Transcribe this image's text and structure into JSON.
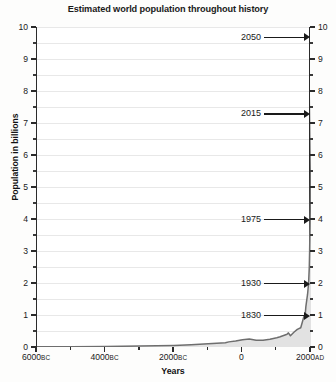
{
  "chart_data": {
    "type": "area",
    "title": "Estimated world population throughout history",
    "xlabel": "Years",
    "ylabel": "Population in billions",
    "xlim": [
      -6000,
      2000
    ],
    "ylim": [
      0,
      10
    ],
    "grid": true,
    "legend": "none",
    "y_ticks": [
      {
        "value": 0,
        "label": "0"
      },
      {
        "value": 1,
        "label": "1"
      },
      {
        "value": 2,
        "label": "2"
      },
      {
        "value": 3,
        "label": "3"
      },
      {
        "value": 4,
        "label": "4"
      },
      {
        "value": 5,
        "label": "5"
      },
      {
        "value": 6,
        "label": "6"
      },
      {
        "value": 7,
        "label": "7"
      },
      {
        "value": 8,
        "label": "8"
      },
      {
        "value": 9,
        "label": "9"
      },
      {
        "value": 10,
        "label": "10"
      }
    ],
    "y_minor_ticks": [
      0.5,
      1.5,
      2.5,
      3.5,
      4.5,
      5.5,
      6.5,
      7.5,
      8.5,
      9.5
    ],
    "x_ticks": [
      {
        "value": -6000,
        "number": "6000",
        "era": "BC"
      },
      {
        "value": -4000,
        "number": "4000",
        "era": "BC"
      },
      {
        "value": -2000,
        "number": "2000",
        "era": "BC"
      },
      {
        "value": 0,
        "number": "0",
        "era": ""
      },
      {
        "value": 2000,
        "number": "2000",
        "era": "AD"
      }
    ],
    "series": [
      {
        "name": "World population",
        "points": [
          [
            -6000,
            0.005
          ],
          [
            -5000,
            0.01
          ],
          [
            -4000,
            0.018
          ],
          [
            -3000,
            0.03
          ],
          [
            -2000,
            0.05
          ],
          [
            -1500,
            0.07
          ],
          [
            -1000,
            0.1
          ],
          [
            -500,
            0.13
          ],
          [
            -400,
            0.16
          ],
          [
            -200,
            0.19
          ],
          [
            0,
            0.23
          ],
          [
            200,
            0.25
          ],
          [
            400,
            0.21
          ],
          [
            600,
            0.21
          ],
          [
            800,
            0.24
          ],
          [
            1000,
            0.29
          ],
          [
            1100,
            0.32
          ],
          [
            1200,
            0.36
          ],
          [
            1300,
            0.4
          ],
          [
            1340,
            0.44
          ],
          [
            1400,
            0.35
          ],
          [
            1500,
            0.46
          ],
          [
            1600,
            0.55
          ],
          [
            1700,
            0.6
          ],
          [
            1750,
            0.79
          ],
          [
            1800,
            0.98
          ],
          [
            1830,
            1.0
          ],
          [
            1850,
            1.26
          ],
          [
            1900,
            1.65
          ],
          [
            1930,
            2.0
          ],
          [
            1950,
            2.5
          ],
          [
            1960,
            3.0
          ],
          [
            1975,
            4.0
          ],
          [
            1987,
            5.0
          ],
          [
            1999,
            6.0
          ],
          [
            2015,
            7.3
          ],
          [
            2030,
            8.5
          ],
          [
            2050,
            9.7
          ]
        ]
      }
    ],
    "annotations": [
      {
        "label": "2050",
        "value": 9.7
      },
      {
        "label": "2015",
        "value": 7.3
      },
      {
        "label": "1975",
        "value": 4.0
      },
      {
        "label": "1930",
        "value": 2.0
      },
      {
        "label": "1830",
        "value": 1.0
      }
    ],
    "colors": {
      "fill": "#e2e2e2",
      "line": "#6e6e6e",
      "axis": "#2b2b2b",
      "grid": "#e8e8e8",
      "text": "#1a1a1a"
    }
  }
}
